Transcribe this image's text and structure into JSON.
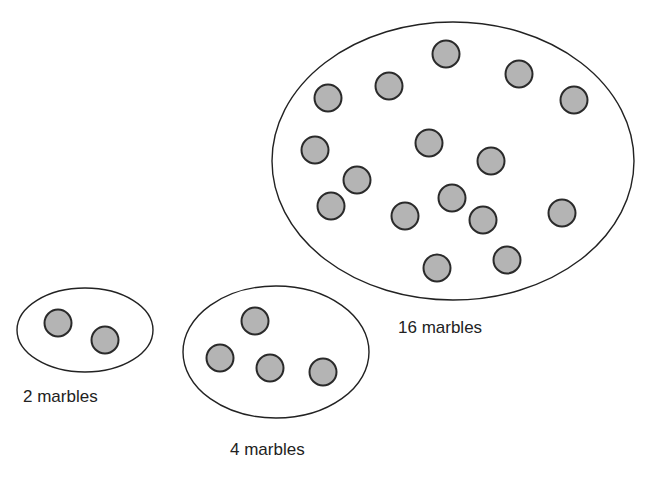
{
  "diagram": {
    "colors": {
      "marble_fill": "#b4b4b4",
      "marble_stroke": "#2a2a2a",
      "outline": "#222222"
    },
    "groups": [
      {
        "id": "two",
        "label": "2 marbles",
        "label_pos": [
          23,
          387
        ],
        "ellipse": {
          "cx": 85,
          "cy": 330,
          "rx": 68,
          "ry": 42
        },
        "marbles": [
          [
            58,
            323
          ],
          [
            105,
            340
          ]
        ]
      },
      {
        "id": "four",
        "label": "4 marbles",
        "label_pos": [
          230,
          440
        ],
        "ellipse": {
          "cx": 276,
          "cy": 352,
          "rx": 93,
          "ry": 66
        },
        "marbles": [
          [
            255,
            321
          ],
          [
            220,
            358
          ],
          [
            270,
            368
          ],
          [
            323,
            372
          ]
        ]
      },
      {
        "id": "sixteen",
        "label": "16 marbles",
        "label_pos": [
          398,
          318
        ],
        "ellipse": {
          "cx": 453,
          "cy": 161,
          "rx": 181,
          "ry": 139
        },
        "marbles": [
          [
            446,
            54
          ],
          [
            519,
            74
          ],
          [
            389,
            86
          ],
          [
            328,
            98
          ],
          [
            574,
            100
          ],
          [
            429,
            143
          ],
          [
            315,
            150
          ],
          [
            491,
            161
          ],
          [
            357,
            180
          ],
          [
            331,
            206
          ],
          [
            452,
            198
          ],
          [
            405,
            216
          ],
          [
            483,
            220
          ],
          [
            562,
            213
          ],
          [
            507,
            260
          ],
          [
            437,
            268
          ]
        ]
      }
    ]
  }
}
